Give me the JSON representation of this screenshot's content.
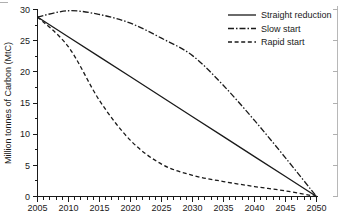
{
  "chart_data": {
    "type": "line",
    "title": "",
    "xlabel": "",
    "ylabel": "Million tonnes of Carbon (MtC)",
    "xlim": [
      2005,
      2050
    ],
    "ylim": [
      0,
      30
    ],
    "grid": false,
    "legend_position": "top-right",
    "x_ticks": [
      2005,
      2010,
      2015,
      2020,
      2025,
      2030,
      2035,
      2040,
      2045,
      2050
    ],
    "x_tick_labels": [
      "2005",
      "2010",
      "2015",
      "2020",
      "2025",
      "2030",
      "2035",
      "2040",
      "2045",
      "2050"
    ],
    "y_ticks": [
      0,
      5,
      10,
      15,
      20,
      25,
      30
    ],
    "y_tick_labels": [
      "0",
      "5",
      "10",
      "15",
      "20",
      "25",
      "30"
    ],
    "x": [
      2005,
      2010,
      2015,
      2020,
      2025,
      2030,
      2035,
      2040,
      2045,
      2050
    ],
    "series": [
      {
        "name": "Straight reduction",
        "style": "solid",
        "color": "#1a1a1a",
        "values": [
          28.8,
          25.6,
          22.4,
          19.2,
          16.0,
          12.8,
          9.6,
          6.4,
          3.2,
          0.0
        ]
      },
      {
        "name": "Slow start",
        "style": "dash-dot",
        "color": "#1a1a1a",
        "values": [
          28.8,
          29.8,
          29.2,
          27.8,
          25.4,
          22.6,
          17.8,
          12.2,
          6.2,
          0.0
        ]
      },
      {
        "name": "Rapid start",
        "style": "dashed",
        "color": "#1a1a1a",
        "values": [
          28.8,
          24.0,
          15.4,
          9.0,
          5.2,
          3.4,
          2.4,
          1.6,
          0.9,
          0.0
        ]
      }
    ]
  },
  "axes": {
    "y_axis_title": "Million tonnes of Carbon (MtC)"
  },
  "legend": {
    "entries": [
      {
        "label": "Straight reduction",
        "style": "solid"
      },
      {
        "label": "Slow start",
        "style": "dash-dot"
      },
      {
        "label": "Rapid start",
        "style": "dashed"
      }
    ]
  }
}
